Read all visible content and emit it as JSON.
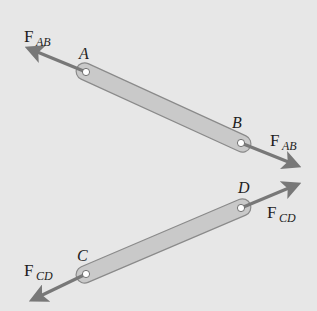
{
  "diagram": {
    "background_color": "#e7e7e7",
    "bar_fill_color": "#c9c9c9",
    "bar_outline_color": "#8a8a8a",
    "arrow_color": "#787878",
    "pin_color": "#ffffff",
    "members": [
      {
        "name": "AB",
        "ends": [
          {
            "label": "A",
            "x": 86,
            "y": 72
          },
          {
            "label": "B",
            "x": 241,
            "y": 143
          }
        ],
        "force_label": "F",
        "force_subscript": "AB",
        "forces": [
          {
            "at": "A",
            "tip": [
              26,
              48
            ]
          },
          {
            "at": "B",
            "tip": [
              300,
              166
            ]
          }
        ]
      },
      {
        "name": "CD",
        "ends": [
          {
            "label": "C",
            "x": 86,
            "y": 274
          },
          {
            "label": "D",
            "x": 241,
            "y": 208
          }
        ],
        "force_label": "F",
        "force_subscript": "CD",
        "forces": [
          {
            "at": "C",
            "tip": [
              30,
              301
            ]
          },
          {
            "at": "D",
            "tip": [
              300,
              183
            ]
          }
        ]
      }
    ],
    "labels": {
      "A": "A",
      "B": "B",
      "C": "C",
      "D": "D",
      "F": "F",
      "AB": "AB",
      "CD": "CD"
    }
  }
}
